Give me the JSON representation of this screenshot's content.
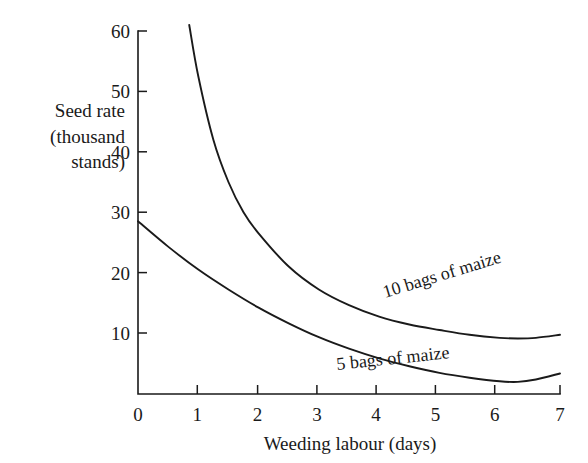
{
  "chart_data": {
    "type": "line",
    "title": "",
    "xlabel": "Weeding labour (days)",
    "ylabel": "Seed rate (thousand stands)",
    "ylabel_lines": [
      "Seed rate",
      "(thousand",
      "stands)"
    ],
    "xlim": [
      0,
      7
    ],
    "ylim": [
      0,
      60
    ],
    "xticks": [
      0,
      1,
      2,
      3,
      4,
      5,
      6,
      7
    ],
    "xtick_labels": [
      "0",
      "1",
      "2",
      "3",
      "4",
      "5",
      "6",
      "7"
    ],
    "yticks": [
      0,
      10,
      20,
      30,
      40,
      50,
      60
    ],
    "ytick_labels": [
      "0",
      "10",
      "20",
      "30",
      "40",
      "50",
      "60"
    ],
    "grid": false,
    "legend_position": "inline-curve-labels",
    "line_color": "#1a1a1a",
    "background_color": "#ffffff",
    "series": [
      {
        "name": "10 bags of maize",
        "label": "10 bags of maize",
        "x": [
          0.85,
          1.0,
          1.25,
          1.5,
          1.75,
          2.0,
          2.5,
          3.0,
          3.5,
          4.0,
          4.5,
          5.0,
          5.5,
          6.0,
          6.3,
          6.6,
          7.0
        ],
        "y": [
          61.0,
          52.5,
          42.0,
          35.0,
          30.0,
          26.5,
          21.0,
          17.2,
          14.6,
          12.7,
          11.4,
          10.5,
          9.7,
          9.2,
          9.1,
          9.2,
          9.7
        ]
      },
      {
        "name": "5 bags of maize",
        "label": "5 bags of maize",
        "x": [
          0.0,
          0.5,
          1.0,
          1.5,
          2.0,
          2.5,
          3.0,
          3.5,
          4.0,
          4.5,
          5.0,
          5.5,
          6.0,
          6.3,
          6.6,
          7.0
        ],
        "y": [
          28.5,
          24.3,
          20.5,
          17.2,
          14.2,
          11.6,
          9.3,
          7.4,
          5.8,
          4.5,
          3.4,
          2.6,
          2.0,
          1.9,
          2.3,
          3.3
        ]
      }
    ]
  },
  "annotations": {
    "series_label_1": "10 bags of maize",
    "series_label_2": "5 bags of maize"
  }
}
